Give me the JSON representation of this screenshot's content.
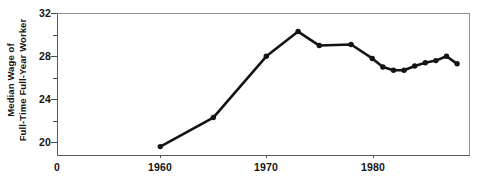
{
  "chart_data": {
    "type": "line",
    "title": "",
    "xlabel": "",
    "ylabel": "Median Wage of Full-Time Full-Year Worker",
    "ylabel_lines": [
      "Median Wage of",
      "Full-Time Full-Year Worker"
    ],
    "xlim": [
      1950.4,
      1989.1
    ],
    "ylim": [
      18.7,
      32.0
    ],
    "y_axis_break": true,
    "y_origin_label": "0",
    "grid": false,
    "legend": null,
    "y_ticks_major": [
      20,
      24,
      28,
      32
    ],
    "y_ticks_major_labels": [
      "20",
      "24",
      "28",
      "32"
    ],
    "y_ticks_minor": [
      22,
      26,
      30
    ],
    "x_ticks_major": [
      1960,
      1970,
      1980
    ],
    "x_ticks_major_labels": [
      "1960",
      "1970",
      "1980"
    ],
    "series": [
      {
        "name": "Median Wage",
        "marker": "circle",
        "color": "#141414",
        "x": [
          1960,
          1965,
          1970,
          1973,
          1975,
          1978,
          1980,
          1981,
          1982,
          1983,
          1984,
          1985,
          1986,
          1987,
          1988
        ],
        "values": [
          19.6,
          22.3,
          28.0,
          30.3,
          29.0,
          29.1,
          27.8,
          27.0,
          26.7,
          26.7,
          27.1,
          27.4,
          27.6,
          28.0,
          27.3
        ]
      }
    ]
  },
  "axes": {
    "y_title_line1": "Median Wage of",
    "y_title_line2": "Full-Time Full-Year Worker",
    "origin": "0"
  }
}
